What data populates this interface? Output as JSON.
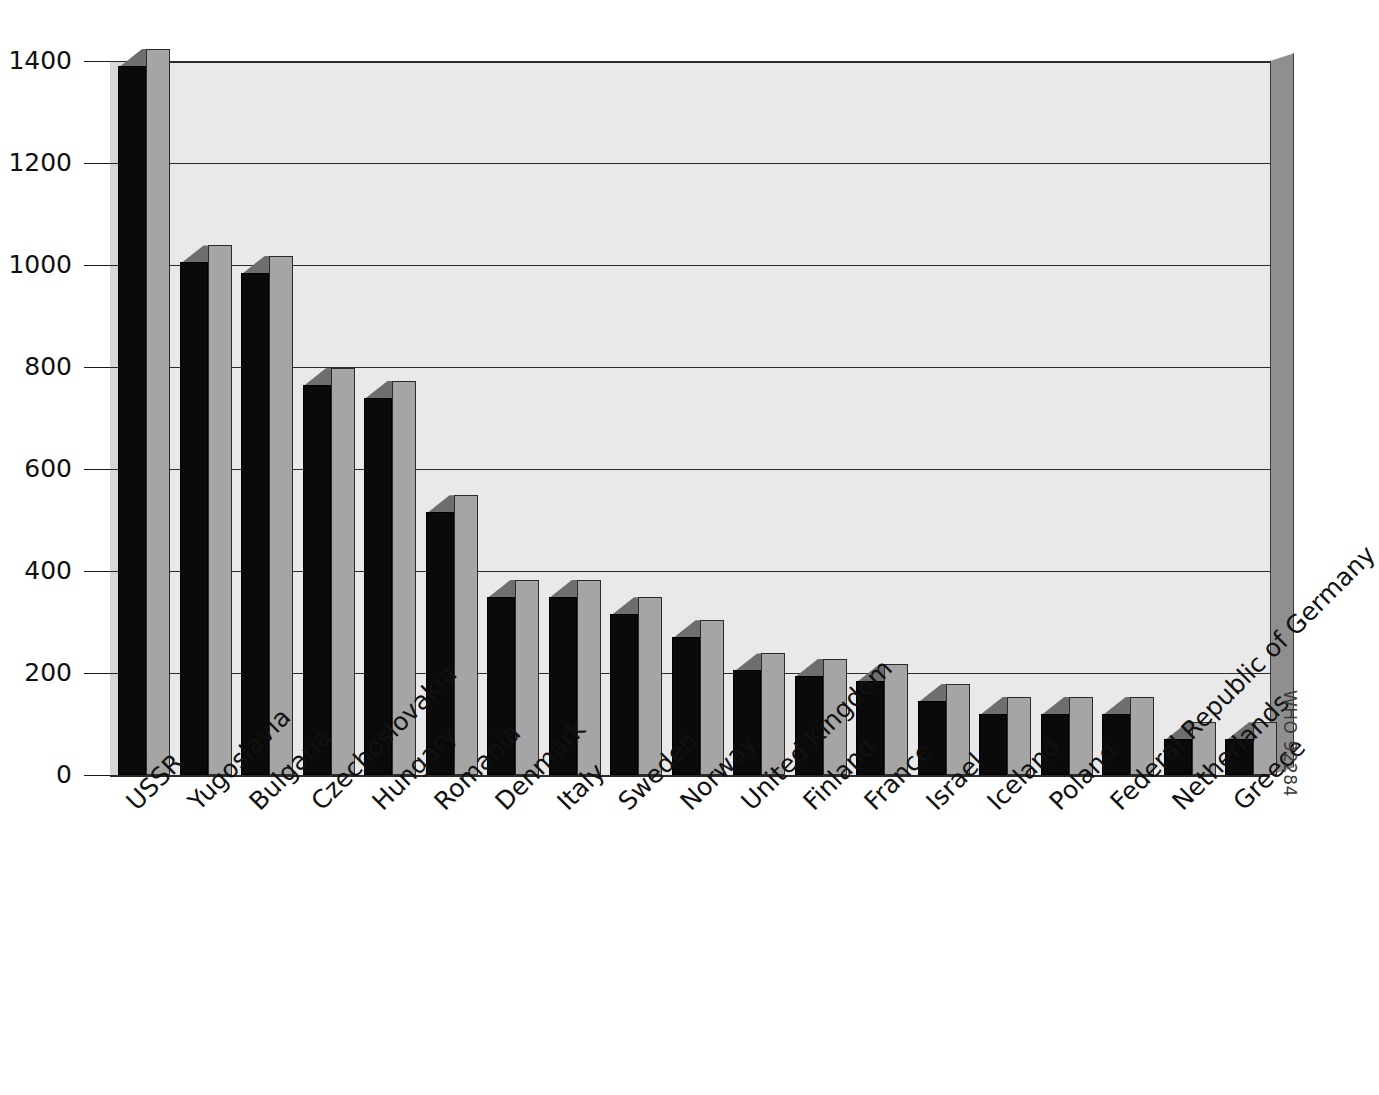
{
  "chart_data": {
    "type": "bar",
    "title": "",
    "xlabel": "",
    "ylabel": "",
    "ylim": [
      0,
      1400
    ],
    "ytick_labels": [
      "1400",
      "1200",
      "1000",
      "800",
      "600",
      "400",
      "200",
      "0"
    ],
    "yticks": [
      1400,
      1200,
      1000,
      800,
      600,
      400,
      200,
      0
    ],
    "grid": true,
    "legend": "none",
    "style": "3d-bar",
    "categories": [
      "USSR",
      "Yugoslavia",
      "Bulgaria",
      "Czechoslovakia",
      "Hungary",
      "Romania",
      "Denmark",
      "Italy",
      "Sweden",
      "Norway",
      "United Kingdom",
      "Finland",
      "France",
      "Israel",
      "Iceland",
      "Poland",
      "Federal Republic of Germany",
      "Netherlands",
      "Greece"
    ],
    "values": [
      1390,
      1005,
      985,
      765,
      740,
      515,
      350,
      350,
      315,
      270,
      205,
      195,
      185,
      145,
      120,
      120,
      120,
      70,
      70
    ]
  },
  "annotations": {
    "source_code": "WHO 92284"
  },
  "colors": {
    "bar_front": "#0a0a0a",
    "bar_side": "#a5a5a5",
    "bar_top": "#6e6e6e",
    "plot_background": "#e9e9e9",
    "wall": "#8f8f8f",
    "axis": "#1a1a1a",
    "page_background": "#ffffff"
  }
}
